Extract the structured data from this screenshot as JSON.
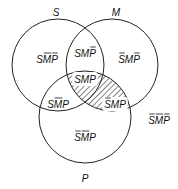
{
  "diagram": {
    "type": "venn",
    "sets": [
      {
        "name": "S",
        "cx": 58,
        "cy": 65,
        "r": 46,
        "label_x": 56,
        "label_y": 16
      },
      {
        "name": "M",
        "cx": 112,
        "cy": 65,
        "r": 46,
        "label_x": 116,
        "label_y": 16
      },
      {
        "name": "P",
        "cx": 85,
        "cy": 117,
        "r": 46,
        "label_x": 85,
        "label_y": 182
      }
    ],
    "shaded_region": "M∩P",
    "regions": [
      {
        "id": "s-only",
        "letters": [
          "S",
          "M",
          "P"
        ],
        "bars": [
          false,
          true,
          true
        ],
        "x": 47,
        "y": 63
      },
      {
        "id": "s-and-m",
        "letters": [
          "S",
          "M",
          "P"
        ],
        "bars": [
          false,
          false,
          true
        ],
        "x": 85,
        "y": 57
      },
      {
        "id": "m-only",
        "letters": [
          "S",
          "M",
          "P"
        ],
        "bars": [
          true,
          false,
          true
        ],
        "x": 129,
        "y": 63
      },
      {
        "id": "s-m-p",
        "letters": [
          "S",
          "M",
          "P"
        ],
        "bars": [
          false,
          false,
          false
        ],
        "x": 85,
        "y": 83
      },
      {
        "id": "s-and-p",
        "letters": [
          "S",
          "M",
          "P"
        ],
        "bars": [
          false,
          true,
          false
        ],
        "x": 58,
        "y": 108
      },
      {
        "id": "m-and-p",
        "letters": [
          "S",
          "M",
          "P"
        ],
        "bars": [
          true,
          false,
          false
        ],
        "x": 115,
        "y": 108
      },
      {
        "id": "p-only",
        "letters": [
          "S",
          "M",
          "P"
        ],
        "bars": [
          true,
          true,
          false
        ],
        "x": 85,
        "y": 141
      },
      {
        "id": "outside",
        "letters": [
          "S",
          "M",
          "P"
        ],
        "bars": [
          true,
          true,
          true
        ],
        "x": 159,
        "y": 124
      }
    ],
    "colors": {
      "stroke": "#222222",
      "hatch": "#333333",
      "text": "#111111"
    }
  }
}
